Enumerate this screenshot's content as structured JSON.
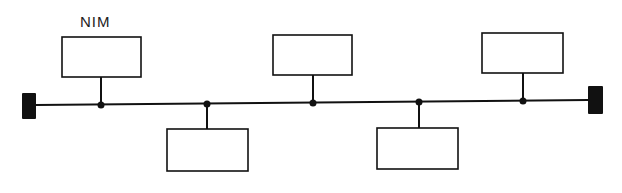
{
  "diagram": {
    "type": "bus-topology",
    "colors": {
      "line": "#111111",
      "background": "#ffffff",
      "box_fill": "#ffffff"
    },
    "bus": {
      "x1": 36,
      "y1": 105,
      "x2": 588,
      "y2": 100,
      "stroke_width": 2
    },
    "terminators": [
      {
        "id": "left-terminator",
        "x": 22,
        "y": 93,
        "w": 14,
        "h": 26
      },
      {
        "id": "right-terminator",
        "x": 588,
        "y": 86,
        "w": 15,
        "h": 28
      }
    ],
    "nodes": [
      {
        "id": "node-1",
        "label": "NIM",
        "position": "above",
        "box": {
          "x": 62,
          "y": 37,
          "w": 79,
          "h": 40
        },
        "tap_x": 101,
        "tap_y": 105
      },
      {
        "id": "node-2",
        "label": "",
        "position": "below",
        "box": {
          "x": 167,
          "y": 129,
          "w": 81,
          "h": 42
        },
        "tap_x": 207,
        "tap_y": 104
      },
      {
        "id": "node-3",
        "label": "",
        "position": "above",
        "box": {
          "x": 273,
          "y": 35,
          "w": 79,
          "h": 40
        },
        "tap_x": 313,
        "tap_y": 103
      },
      {
        "id": "node-4",
        "label": "",
        "position": "below",
        "box": {
          "x": 377,
          "y": 128,
          "w": 81,
          "h": 41
        },
        "tap_x": 419,
        "tap_y": 102
      },
      {
        "id": "node-5",
        "label": "",
        "position": "above",
        "box": {
          "x": 482,
          "y": 33,
          "w": 81,
          "h": 40
        },
        "tap_x": 523,
        "tap_y": 101
      }
    ],
    "labels": [
      {
        "id": "nim-label",
        "text": "NIM",
        "x": 80,
        "y": 13
      }
    ]
  }
}
